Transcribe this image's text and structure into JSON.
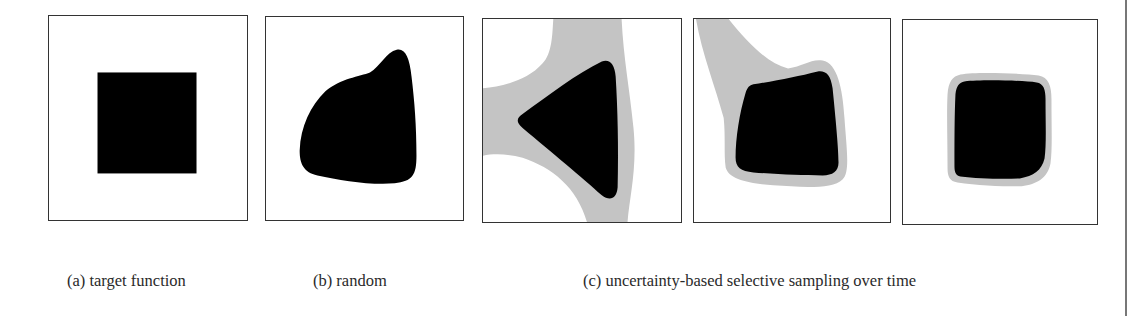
{
  "figure": {
    "colors": {
      "inside": "#000000",
      "uncertain": "#c4c4c4",
      "outside": "#ffffff",
      "frame": "#333333"
    },
    "panels": [
      {
        "id": "a",
        "caption": "(a) target function",
        "shape": "square"
      },
      {
        "id": "b",
        "caption": "(b) random",
        "shape": "irregular-blob"
      },
      {
        "id": "c1",
        "caption": "",
        "shape": "triangle-with-wide-uncertainty-band"
      },
      {
        "id": "c2",
        "caption": "",
        "shape": "quadrilateral-with-uncertainty-halo"
      },
      {
        "id": "c3",
        "caption": "",
        "shape": "rounded-square-with-thin-halo"
      }
    ],
    "captions": {
      "a": "(a) target function",
      "b": "(b) random",
      "c": "(c) uncertainty-based selective sampling over time"
    }
  }
}
